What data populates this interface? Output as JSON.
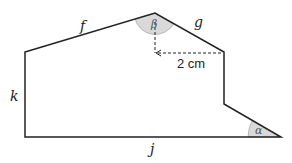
{
  "diagram": {
    "sides": {
      "f": "f",
      "g": "g",
      "k": "k",
      "j": "j"
    },
    "angles": {
      "alpha": "α",
      "beta": "β"
    },
    "measurement": "2 cm",
    "colors": {
      "stroke": "#222222",
      "angle_fill": "#d9d9d9",
      "background": "#ffffff"
    }
  }
}
